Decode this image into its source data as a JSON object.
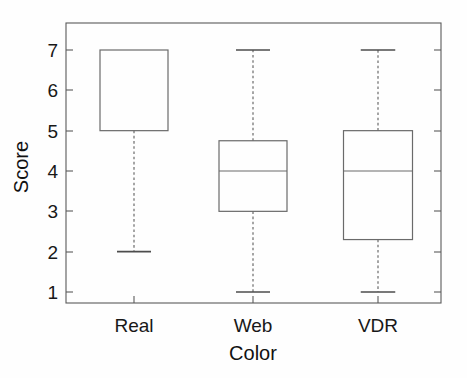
{
  "chart_data": {
    "type": "box",
    "title": "",
    "xlabel": "Color",
    "ylabel": "Score",
    "categories": [
      "Real",
      "Web",
      "VDR"
    ],
    "ylim": [
      0.7,
      7.6
    ],
    "yticks": [
      1,
      2,
      3,
      4,
      5,
      6,
      7
    ],
    "ytick_labels": [
      "1",
      "2",
      "3",
      "4",
      "5",
      "6",
      "7"
    ],
    "grid": false,
    "legend": null,
    "boxes": [
      {
        "name": "Real",
        "whisker_low": 2,
        "q1": 5,
        "median": 7,
        "q3": 7,
        "whisker_high": 7,
        "median_drawn": false
      },
      {
        "name": "Web",
        "whisker_low": 1,
        "q1": 3,
        "median": 4,
        "q3": 4.75,
        "whisker_high": 7,
        "median_drawn": true
      },
      {
        "name": "VDR",
        "whisker_low": 1,
        "q1": 2.3,
        "median": 4,
        "q3": 5,
        "whisker_high": 7,
        "median_drawn": true
      }
    ]
  },
  "axis": {
    "y_title": "Score",
    "x_title": "Color",
    "tick_1": "1",
    "tick_2": "2",
    "tick_3": "3",
    "tick_4": "4",
    "tick_5": "5",
    "tick_6": "6",
    "tick_7": "7"
  },
  "categories": {
    "cat_0": "Real",
    "cat_1": "Web",
    "cat_2": "VDR"
  }
}
